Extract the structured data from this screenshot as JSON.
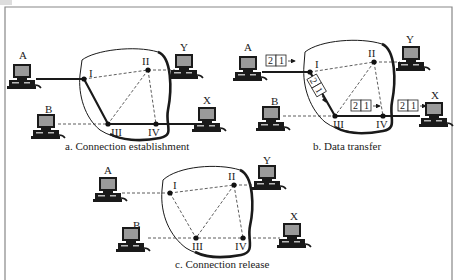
{
  "figure": {
    "frame_color": "#888888",
    "line_color": "#1a1a1a"
  },
  "panels": [
    {
      "id": "a",
      "caption": "a. Connection establishment",
      "hosts": [
        {
          "name": "A"
        },
        {
          "name": "B"
        },
        {
          "name": "X"
        },
        {
          "name": "Y"
        }
      ],
      "switches": [
        "I",
        "II",
        "III",
        "IV"
      ],
      "path": "A – I – III – IV – X"
    },
    {
      "id": "b",
      "caption": "b. Data transfer",
      "hosts": [
        {
          "name": "A"
        },
        {
          "name": "B"
        },
        {
          "name": "X"
        },
        {
          "name": "Y"
        }
      ],
      "switches": [
        "I",
        "II",
        "III",
        "IV"
      ],
      "packets": [
        {
          "location": "A→I",
          "cells": [
            "2",
            "1"
          ]
        },
        {
          "location": "I→III",
          "cells": [
            "2",
            "1"
          ]
        },
        {
          "location": "III→IV",
          "cells": [
            "2",
            "1"
          ]
        },
        {
          "location": "IV→X",
          "cells": [
            "2",
            "1"
          ]
        }
      ],
      "path": "A – I – III – IV – X"
    },
    {
      "id": "c",
      "caption": "c. Connection release",
      "hosts": [
        {
          "name": "A"
        },
        {
          "name": "B"
        },
        {
          "name": "X"
        },
        {
          "name": "Y"
        }
      ],
      "switches": [
        "I",
        "II",
        "III",
        "IV"
      ],
      "path": ""
    }
  ]
}
